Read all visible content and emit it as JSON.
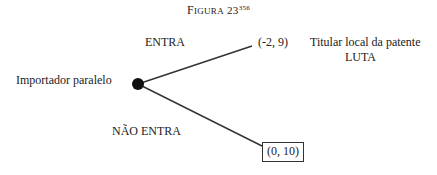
{
  "figure": {
    "title_prefix": "F",
    "title_rest": "IGURA",
    "number": "23",
    "footnote": "356"
  },
  "players": {
    "entrant": "Importador paralelo",
    "incumbent": "Titular local da patente",
    "incumbent_action": "LUTA"
  },
  "branches": [
    {
      "action": "ENTRA",
      "payoff": "(-2, 9)",
      "boxed": false
    },
    {
      "action": "NÃO ENTRA",
      "payoff": "(0, 10)",
      "boxed": true
    }
  ],
  "colors": {
    "line": "#333333",
    "node": "#111111",
    "text": "#222222"
  }
}
